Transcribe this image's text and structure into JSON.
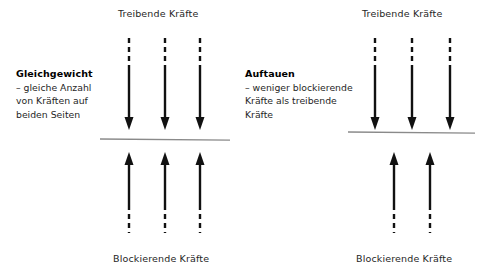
{
  "figure": {
    "type": "force-field-analysis-diagram",
    "background_color": "#ffffff",
    "stroke_color": "#111111",
    "divider_color": "#8a8a8a",
    "width": 484,
    "height": 278
  },
  "panels": [
    {
      "id": "gleichgewicht",
      "top_label": "Treibende Kräfte",
      "bottom_label": "Blockierende Kräfte",
      "title": "Gleichgewicht",
      "description_lines": [
        "– gleiche Anzahl",
        "von Kräften auf",
        "beiden Seiten"
      ],
      "driving_arrow_count": 3,
      "blocking_arrow_count": 3,
      "divider_y": 139,
      "divider_x_start": 100,
      "divider_x_end": 230
    },
    {
      "id": "auftauen",
      "top_label": "Treibende Kräfte",
      "bottom_label": "Blockierende Kräfte",
      "title": "Auftauen",
      "description_lines": [
        "– weniger blockierende",
        "Kräfte als treibende",
        "Kräfte"
      ],
      "driving_arrow_count": 3,
      "blocking_arrow_count": 2,
      "divider_y": 132,
      "divider_x_start": 348,
      "divider_x_end": 475
    }
  ],
  "arrow_geometry": {
    "down_dash_top": 38,
    "down_dash_bottom": 68,
    "down_solid_bottom": 130,
    "up_tip_top": 152,
    "up_solid_top": 205,
    "up_dash_bottom": 233,
    "left_columns_x": [
      129,
      165,
      200
    ],
    "right_top_columns_x": [
      375,
      412,
      450
    ],
    "right_bottom_columns_x": [
      394,
      430
    ],
    "dash_pattern": "5 4",
    "stroke_width": 2.4,
    "head_width": 9,
    "head_length": 13
  }
}
